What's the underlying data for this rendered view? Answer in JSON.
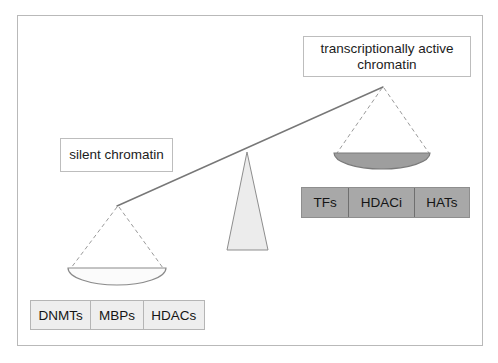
{
  "figure": {
    "kind": "balance-scale-diagram",
    "frame_border_color": "#b9b9b9",
    "background_color": "#ffffff"
  },
  "labels": {
    "active": "transcriptionally active chromatin",
    "active_line1": "transcriptionally active",
    "active_line2": "chromatin",
    "silent": "silent chromatin"
  },
  "repressive_factors": {
    "fill_color": "#eeeeee",
    "items": [
      "DNMTs",
      "MBPs",
      "HDACs"
    ]
  },
  "activating_factors": {
    "fill_color": "#a8a8a8",
    "items": [
      "TFs",
      "HDACi",
      "HATs"
    ]
  },
  "scale": {
    "beam_color": "#777777",
    "string_color": "#999999",
    "fulcrum_fill": "#ececec",
    "fulcrum_stroke": "#8d8d8d",
    "left_pan_fill": "#fbfbfb",
    "left_pan_stroke": "#8a8a8a",
    "right_pan_fill": "#9e9e9e",
    "right_pan_stroke": "#7a7a7a",
    "tilt": "down-left",
    "left_end": "silent chromatin side (heavy, lowered)",
    "right_end": "transcriptionally active chromatin side (light, raised)"
  }
}
